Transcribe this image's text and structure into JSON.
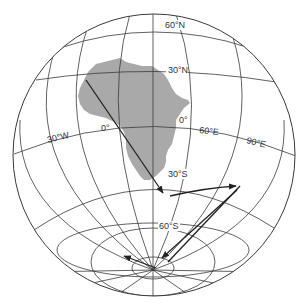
{
  "figure": {
    "type": "orthographic globe projection",
    "landmass": "Africa",
    "land_color": "#a9a9a9",
    "line_color": "#3a3a3a",
    "path_color": "#222222"
  },
  "labels": {
    "lat_60n": "60°N",
    "lat_30n": "30°N",
    "lat_0": "0°",
    "lat_30s": "30°S",
    "lat_60s": "60°S",
    "lon_30w": "30°W",
    "lon_0": "0°",
    "lon_60e": "60°E",
    "lon_90e": "90°E"
  },
  "path": {
    "description": "polar wander path with arrows",
    "segments": [
      {
        "from": "NW Africa",
        "to": "south of Africa (~35°S)"
      },
      {
        "from": "~35°S 20°E",
        "to": "~35°S 90°E"
      },
      {
        "from": "~35°S 90°E",
        "to": "near south pole"
      },
      {
        "from": "near south pole",
        "to": "~70°S 30°W"
      }
    ]
  }
}
